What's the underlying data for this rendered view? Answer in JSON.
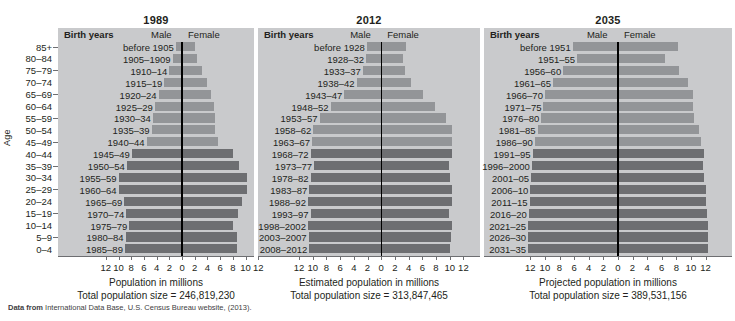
{
  "figure": {
    "age_axis_title": "Age",
    "age_groups": [
      "85+",
      "80–84",
      "75–79",
      "70–74",
      "65–69",
      "60–64",
      "55–59",
      "50–54",
      "45–49",
      "40–44",
      "35–39",
      "30–34",
      "25–29",
      "20–24",
      "15–19",
      "10–14",
      "5–9",
      "0–4"
    ],
    "source_prefix": "Data from",
    "source_text": "International Data Base, U.S. Census Bureau website, (2013)."
  },
  "colors": {
    "panel_background": "#c9cacc",
    "bar_light": "#939598",
    "bar_dark": "#6d6e71",
    "center_line": "#000000",
    "text": "#231f20"
  },
  "axis": {
    "ticks": [
      "12",
      "10",
      "8",
      "6",
      "4",
      "2",
      "0",
      "2",
      "4",
      "6",
      "8",
      "10",
      "12"
    ],
    "tick_values": [
      -12,
      -10,
      -8,
      -6,
      -4,
      -2,
      0,
      2,
      4,
      6,
      8,
      10,
      12
    ],
    "xlim": [
      -12,
      12
    ]
  },
  "columns": {
    "birth_years": "Birth years",
    "male": "Male",
    "female": "Female"
  },
  "chart_data": {
    "type": "bar",
    "subtype": "population-pyramid",
    "xlabel": "Population in millions",
    "ylabel": "Age",
    "xlim": [
      -12,
      12
    ],
    "grid": false,
    "legend": [
      "Male",
      "Female"
    ],
    "legend_position": "top-inside",
    "categories": [
      "85+",
      "80–84",
      "75–79",
      "70–74",
      "65–69",
      "60–64",
      "55–59",
      "50–54",
      "45–49",
      "40–44",
      "35–39",
      "30–34",
      "25–29",
      "20–24",
      "15–19",
      "10–14",
      "5–9",
      "0–4"
    ],
    "panels": [
      {
        "title": "1989",
        "axis_label": "Population in millions",
        "total_label": "Total population size = 246,819,230",
        "total_population": "246,819,230",
        "birth_years": [
          "before 1905",
          "1905–1909",
          "1910–14",
          "1915–19",
          "1920–24",
          "1925–29",
          "1930–34",
          "1935–39",
          "1940–44",
          "1945–49",
          "1950–54",
          "1955–59",
          "1960–64",
          "1965–69",
          "1970–74",
          "1975–79",
          "1980–84",
          "1985–89"
        ],
        "shades": [
          "light",
          "light",
          "light",
          "light",
          "light",
          "light",
          "light",
          "light",
          "light",
          "dark",
          "dark",
          "dark",
          "dark",
          "dark",
          "dark",
          "dark",
          "dark",
          "dark"
        ],
        "series": [
          {
            "name": "Male",
            "values": [
              1.0,
              1.5,
              2.0,
              2.8,
              3.7,
              4.3,
              4.6,
              4.8,
              5.6,
              7.9,
              8.7,
              10.0,
              10.0,
              9.1,
              8.8,
              8.3,
              8.9,
              9.0
            ]
          },
          {
            "name": "Female",
            "values": [
              2.0,
              2.4,
              3.1,
              3.9,
              4.6,
              5.1,
              5.2,
              5.2,
              5.7,
              8.0,
              8.9,
              10.3,
              10.2,
              9.4,
              8.8,
              8.0,
              8.6,
              8.6
            ]
          }
        ]
      },
      {
        "title": "2012",
        "axis_label": "Estimated population in millions",
        "total_label": "Total population size = 313,847,465",
        "total_population": "313,847,465",
        "birth_years": [
          "before 1928",
          "1928–32",
          "1933–37",
          "1938–42",
          "1943–47",
          "1948–52",
          "1953–57",
          "1958–62",
          "1963–67",
          "1968–72",
          "1973–77",
          "1978–82",
          "1983–87",
          "1988–92",
          "1993–97",
          "1998–2002",
          "2003–2007",
          "2008–2012"
        ],
        "shades": [
          "light",
          "light",
          "light",
          "light",
          "light",
          "light",
          "light",
          "light",
          "light",
          "dark",
          "dark",
          "dark",
          "dark",
          "dark",
          "dark",
          "dark",
          "dark",
          "dark"
        ],
        "series": [
          {
            "name": "Male",
            "values": [
              2.1,
              2.2,
              2.7,
              3.6,
              5.4,
              7.4,
              9.0,
              9.9,
              10.1,
              10.3,
              9.8,
              10.3,
              10.5,
              10.7,
              10.3,
              10.7,
              10.6,
              10.5
            ]
          },
          {
            "name": "Female",
            "values": [
              3.6,
              3.2,
              3.5,
              4.4,
              6.1,
              7.9,
              9.5,
              10.3,
              10.4,
              10.4,
              9.9,
              10.1,
              10.3,
              10.3,
              9.9,
              10.3,
              10.2,
              10.1
            ]
          }
        ]
      },
      {
        "title": "2035",
        "axis_label": "Projected population in millions",
        "total_label": "Total population size = 389,531,156",
        "total_population": "389,531,156",
        "birth_years": [
          "before 1951",
          "1951–55",
          "1956–60",
          "1961–65",
          "1966–70",
          "1971–75",
          "1976–80",
          "1981–85",
          "1986–90",
          "1991–95",
          "1996–2000",
          "2001–05",
          "2006–10",
          "2011–15",
          "2016–20",
          "2021–25",
          "2026–30",
          "2031–35"
        ],
        "shades": [
          "light",
          "light",
          "light",
          "light",
          "light",
          "light",
          "light",
          "light",
          "light",
          "dark",
          "dark",
          "dark",
          "dark",
          "dark",
          "dark",
          "dark",
          "dark",
          "dark"
        ],
        "series": [
          {
            "name": "Male",
            "values": [
              6.2,
              5.6,
              7.5,
              8.9,
              10.0,
              10.2,
              10.5,
              11.0,
              11.4,
              11.7,
              11.8,
              11.9,
              12.0,
              12.1,
              12.2,
              12.3,
              12.3,
              12.3
            ]
          },
          {
            "name": "Female",
            "values": [
              8.2,
              6.4,
              8.4,
              9.6,
              10.3,
              10.3,
              10.4,
              11.1,
              11.4,
              11.8,
              11.7,
              11.8,
              12.0,
              12.1,
              12.2,
              12.3,
              12.3,
              12.3
            ]
          }
        ]
      }
    ]
  }
}
